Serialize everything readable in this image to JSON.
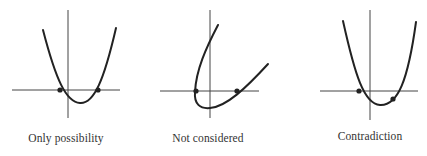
{
  "colors": {
    "ink": "#222222",
    "axis": "#444444",
    "text": "#333333",
    "background": "#ffffff"
  },
  "panels": [
    {
      "id": "only-possibility",
      "label": "Only possibility",
      "description": "Upward parabola crossing the x-axis at two marked points, one on each side near the origin",
      "axes": {
        "x_axis": [
          12,
          90,
          120,
          90
        ],
        "y_axis": [
          68,
          10,
          68,
          118
        ]
      },
      "curve": "M43,30 C56,80 66,102 80,103 C94,104 104,80 116,28",
      "points": [
        [
          60,
          90
        ],
        [
          98,
          90
        ]
      ],
      "label_pos": [
        66,
        132
      ]
    },
    {
      "id": "not-considered",
      "label": "Not considered",
      "description": "Sideways (rotated) parabola opening upward-right, crossing the x-axis at two marked points",
      "axes": {
        "x_axis": [
          160,
          91,
          259,
          91
        ],
        "y_axis": [
          210,
          10,
          210,
          118
        ]
      },
      "curve": "M218,25 C206,48 196,70 195,92 C194,104 200,109 210,108 C226,107 246,88 268,64",
      "points": [
        [
          196,
          91
        ],
        [
          237,
          91
        ]
      ],
      "label_pos": [
        208,
        132
      ]
    },
    {
      "id": "contradiction",
      "label": "Contradiction",
      "description": "Upward parabola with one marked point on the x-axis and another marked point below the axis",
      "axes": {
        "x_axis": [
          320,
          91,
          418,
          91
        ],
        "y_axis": [
          370,
          10,
          370,
          120
        ]
      },
      "curve": "M343,21 C355,75 364,104 380,105 C398,106 408,80 416,22",
      "points": [
        [
          359,
          91
        ],
        [
          393,
          99
        ]
      ],
      "label_pos": [
        370,
        130
      ]
    }
  ]
}
